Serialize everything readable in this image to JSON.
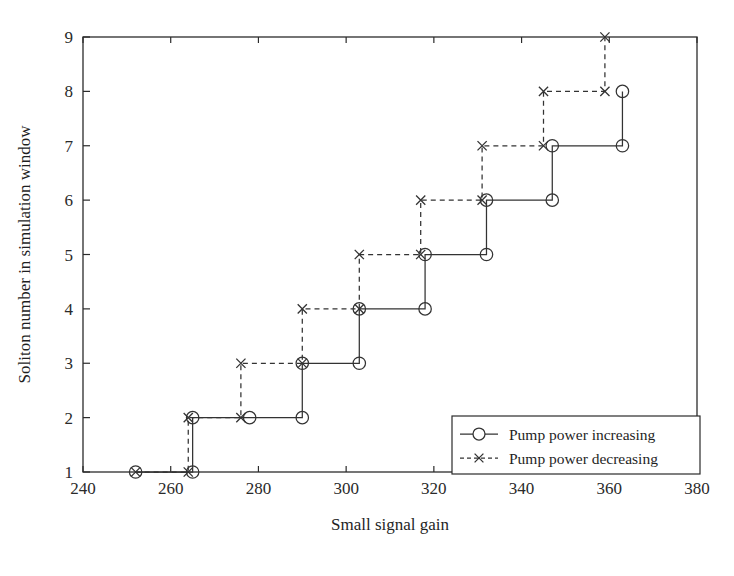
{
  "chart_data": {
    "type": "line",
    "title": "",
    "xlabel": "Small signal gain",
    "ylabel": "Soliton number in simulation window",
    "xlim": [
      240,
      380
    ],
    "ylim": [
      1,
      9
    ],
    "xticks": [
      240,
      260,
      280,
      300,
      320,
      340,
      360,
      380
    ],
    "yticks": [
      1,
      2,
      3,
      4,
      5,
      6,
      7,
      8,
      9
    ],
    "grid": false,
    "legend_position": "lower right",
    "series": [
      {
        "name": "Pump power increasing",
        "marker": "circle",
        "linestyle": "solid",
        "color": "#333333",
        "points": [
          {
            "x": 252,
            "y": 1
          },
          {
            "x": 265,
            "y": 1
          },
          {
            "x": 265,
            "y": 2
          },
          {
            "x": 278,
            "y": 2
          },
          {
            "x": 290,
            "y": 2
          },
          {
            "x": 290,
            "y": 3
          },
          {
            "x": 303,
            "y": 3
          },
          {
            "x": 303,
            "y": 4
          },
          {
            "x": 318,
            "y": 4
          },
          {
            "x": 318,
            "y": 5
          },
          {
            "x": 332,
            "y": 5
          },
          {
            "x": 332,
            "y": 6
          },
          {
            "x": 347,
            "y": 6
          },
          {
            "x": 347,
            "y": 7
          },
          {
            "x": 363,
            "y": 7
          },
          {
            "x": 363,
            "y": 8
          }
        ],
        "markers": [
          {
            "x": 252,
            "y": 1
          },
          {
            "x": 265,
            "y": 1
          },
          {
            "x": 265,
            "y": 2
          },
          {
            "x": 278,
            "y": 2
          },
          {
            "x": 290,
            "y": 2
          },
          {
            "x": 290,
            "y": 3
          },
          {
            "x": 303,
            "y": 3
          },
          {
            "x": 303,
            "y": 4
          },
          {
            "x": 318,
            "y": 4
          },
          {
            "x": 318,
            "y": 5
          },
          {
            "x": 332,
            "y": 5
          },
          {
            "x": 332,
            "y": 6
          },
          {
            "x": 347,
            "y": 6
          },
          {
            "x": 347,
            "y": 7
          },
          {
            "x": 363,
            "y": 7
          },
          {
            "x": 363,
            "y": 8
          }
        ]
      },
      {
        "name": "Pump power decreasing",
        "marker": "x",
        "linestyle": "dashed",
        "color": "#333333",
        "points": [
          {
            "x": 252,
            "y": 1
          },
          {
            "x": 264,
            "y": 1
          },
          {
            "x": 264,
            "y": 2
          },
          {
            "x": 276,
            "y": 2
          },
          {
            "x": 276,
            "y": 3
          },
          {
            "x": 290,
            "y": 3
          },
          {
            "x": 290,
            "y": 4
          },
          {
            "x": 303,
            "y": 4
          },
          {
            "x": 303,
            "y": 5
          },
          {
            "x": 317,
            "y": 5
          },
          {
            "x": 317,
            "y": 6
          },
          {
            "x": 331,
            "y": 6
          },
          {
            "x": 331,
            "y": 7
          },
          {
            "x": 345,
            "y": 7
          },
          {
            "x": 345,
            "y": 8
          },
          {
            "x": 359,
            "y": 8
          },
          {
            "x": 359,
            "y": 9
          }
        ],
        "markers": [
          {
            "x": 252,
            "y": 1
          },
          {
            "x": 264,
            "y": 1
          },
          {
            "x": 264,
            "y": 2
          },
          {
            "x": 276,
            "y": 2
          },
          {
            "x": 276,
            "y": 3
          },
          {
            "x": 290,
            "y": 3
          },
          {
            "x": 290,
            "y": 4
          },
          {
            "x": 303,
            "y": 4
          },
          {
            "x": 303,
            "y": 5
          },
          {
            "x": 317,
            "y": 5
          },
          {
            "x": 317,
            "y": 6
          },
          {
            "x": 331,
            "y": 6
          },
          {
            "x": 331,
            "y": 7
          },
          {
            "x": 345,
            "y": 7
          },
          {
            "x": 345,
            "y": 8
          },
          {
            "x": 359,
            "y": 8
          },
          {
            "x": 359,
            "y": 9
          }
        ]
      }
    ]
  },
  "axes": {
    "xlabel": "Small signal gain",
    "ylabel": "Soliton number in simulation window",
    "xtick_labels": [
      "240",
      "260",
      "280",
      "300",
      "320",
      "340",
      "360",
      "380"
    ],
    "ytick_labels": [
      "1",
      "2",
      "3",
      "4",
      "5",
      "6",
      "7",
      "8",
      "9"
    ]
  },
  "legend": {
    "entries": [
      {
        "label": "Pump power increasing",
        "marker": "circle-marker",
        "linestyle": "solid"
      },
      {
        "label": "Pump power decreasing",
        "marker": "x-marker",
        "linestyle": "dashed"
      }
    ]
  },
  "colors": {
    "line": "#333333",
    "axis": "#2b2b2b",
    "background": "#ffffff"
  }
}
